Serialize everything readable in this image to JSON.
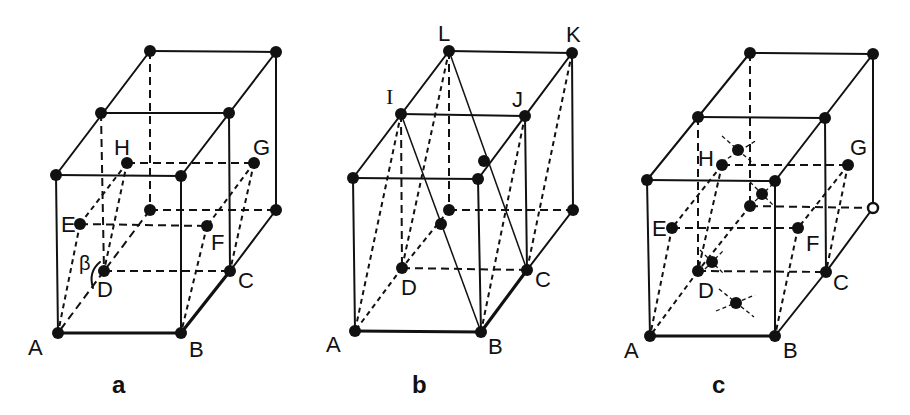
{
  "figure": {
    "panels": [
      {
        "id": "a",
        "caption": "a",
        "labels": {
          "A": "A",
          "B": "B",
          "C": "C",
          "D": "D",
          "E": "E",
          "F": "F",
          "G": "G",
          "H": "H",
          "angle": "β"
        }
      },
      {
        "id": "b",
        "caption": "b",
        "labels": {
          "A": "A",
          "B": "B",
          "C": "C",
          "D": "D",
          "I": "I",
          "J": "J",
          "K": "K",
          "L": "L"
        }
      },
      {
        "id": "c",
        "caption": "c",
        "labels": {
          "A": "A",
          "B": "B",
          "C": "C",
          "D": "D",
          "E": "E",
          "F": "F",
          "G": "G",
          "H": "H"
        }
      }
    ],
    "colors": {
      "ink": "#111111",
      "background": "#ffffff"
    }
  }
}
